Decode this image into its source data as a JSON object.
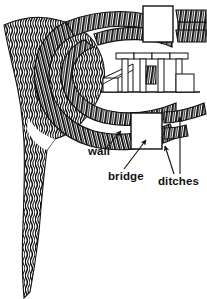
{
  "figure": {
    "kind": "site-plan-line-drawing",
    "background_color": "#ffffff",
    "ink_color": "#111111",
    "width": 207,
    "height": 299
  },
  "labels": [
    {
      "id": "wall",
      "text": "wall",
      "x": 88,
      "y": 152
    },
    {
      "id": "bridge",
      "text": "bridge",
      "x": 108,
      "y": 177
    },
    {
      "id": "ditches",
      "text": "ditches",
      "x": 158,
      "y": 182
    }
  ],
  "features": {
    "escarpment": {
      "name": "escarpment-cliff-hatching",
      "description": "wavy vertical hatching mass along left side and tapering tail"
    },
    "wall_band": {
      "name": "defensive-wall-band",
      "description": "inner horseshoe hatched band"
    },
    "ditch_bands": {
      "name": "ditch-bands",
      "count": 2,
      "description": "outer horseshoe hatched bands forming ditches"
    },
    "bridges": {
      "name": "bridge-causeways",
      "count": 2,
      "description": "blank rectangular gaps crossing the wall at top and bottom"
    },
    "temple": {
      "name": "temple-elevation",
      "columns": 4,
      "has_stairway": true,
      "has_ground_line": true,
      "description": "small elevation drawing of a colonnaded building with steps"
    }
  },
  "arrows": [
    {
      "id": "wall-leader",
      "from": [
        104,
        148
      ],
      "to": [
        120,
        131
      ]
    },
    {
      "id": "bridge-leader",
      "from": [
        124,
        170
      ],
      "to": [
        145,
        140
      ]
    },
    {
      "id": "ditch-leader-1",
      "from": [
        172,
        176
      ],
      "to": [
        164,
        146
      ]
    },
    {
      "id": "ditch-leader-2",
      "from": [
        178,
        176
      ],
      "to": [
        178,
        116
      ]
    }
  ]
}
